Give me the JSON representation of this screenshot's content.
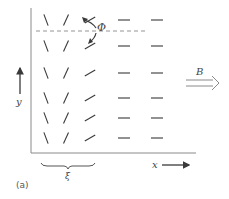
{
  "figure": {
    "panel_label": "(a)",
    "labels": {
      "y_axis": "y",
      "x_axis": "x",
      "field": "B",
      "angle": "Φ",
      "period": "ξ"
    },
    "colors": {
      "ink": "#3a3a3a",
      "axis": "#8a8a8a",
      "background": "#ffffff"
    },
    "grid": {
      "columns_x": [
        46,
        66,
        90,
        124,
        157
      ],
      "rows_y": [
        20,
        46,
        73,
        98,
        118,
        138
      ],
      "column_angles_deg": [
        -70,
        65,
        30,
        0,
        0
      ],
      "description": "Director orientation rotating from near-vertical (left) through tilted to horizontal (right), aligned with field B"
    },
    "axes": {
      "left_x": 31,
      "bottom_y": 153,
      "top_y": 8,
      "right_x": 196
    }
  }
}
